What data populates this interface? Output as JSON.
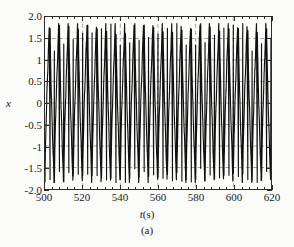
{
  "figure": {
    "subcaption": "(a)",
    "background_color": "#fbfbf9",
    "frame_color": "#2b2b2b",
    "grid_color": "#8e8e8e",
    "trace_color": "#111111"
  },
  "axes": {
    "y_title": "x",
    "x_title_var": "t",
    "x_title_unit": "(s)"
  },
  "chart_data": {
    "type": "line",
    "title": "",
    "subtitle": "(a)",
    "xlabel": "t(s)",
    "ylabel": "x",
    "xlim": [
      500,
      620
    ],
    "ylim": [
      -2.0,
      2.0
    ],
    "grid": true,
    "legend": "none",
    "x_major_ticks": [
      500,
      520,
      540,
      560,
      580,
      600,
      620
    ],
    "x_tick_labels": [
      "500",
      "520",
      "540",
      "560",
      "580",
      "600",
      "620"
    ],
    "x_minor_tick_step": 4,
    "y_major_ticks": [
      2.0,
      1.5,
      1.0,
      0.5,
      0.0,
      -0.5,
      -1.0,
      -1.5,
      -2.0
    ],
    "y_tick_labels": [
      "2.0",
      "1.5",
      "1",
      "0.5",
      "0",
      "-0.5",
      "-1",
      "-1.5",
      "-2.0"
    ],
    "series": [
      {
        "name": "x(t)",
        "description": "periodic relaxation-type oscillation with sharp spikes",
        "period": 5.0,
        "peak_value": 1.85,
        "trough_value": -1.85,
        "cycle_count": 24,
        "x": [
          500,
          502.5,
          505,
          507.5,
          510,
          512.5,
          515,
          517.5,
          520,
          522.5,
          525,
          527.5,
          530,
          532.5,
          535,
          537.5,
          540,
          542.5,
          545,
          547.5,
          550,
          552.5,
          555,
          557.5,
          560,
          562.5,
          565,
          567.5,
          570,
          572.5,
          575,
          577.5,
          580,
          582.5,
          585,
          587.5,
          590,
          592.5,
          595,
          597.5,
          600,
          602.5,
          605,
          607.5,
          610,
          612.5,
          615,
          617.5,
          620
        ],
        "values": [
          1.85,
          -1.85,
          1.85,
          -1.85,
          1.85,
          -1.85,
          1.85,
          -1.85,
          1.85,
          -1.85,
          1.85,
          -1.85,
          1.85,
          -1.85,
          1.85,
          -1.85,
          1.85,
          -1.85,
          1.85,
          -1.85,
          1.85,
          -1.85,
          1.85,
          -1.85,
          1.85,
          -1.85,
          1.85,
          -1.85,
          1.85,
          -1.85,
          1.85,
          -1.85,
          1.85,
          -1.85,
          1.85,
          -1.85,
          1.85,
          -1.85,
          1.85,
          -1.85,
          1.85,
          -1.85,
          1.85,
          -1.85,
          1.85,
          -1.85,
          1.85,
          -1.85,
          1.85
        ]
      }
    ]
  }
}
